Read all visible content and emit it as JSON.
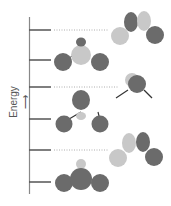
{
  "axis": {
    "label": "Energy",
    "arrow": "↑"
  },
  "colors": {
    "dark_lobe": "#6b6b6b",
    "light_lobe": "#c8c8c8",
    "axis": "#777777",
    "bond": "#333333",
    "dotted": "#aaaaaa"
  },
  "levels": [
    {
      "index": 1,
      "y": 182,
      "side": "left",
      "orbital": "bonding-all-in-phase"
    },
    {
      "index": 2,
      "y": 150,
      "side": "right",
      "orbital": "p-type-node"
    },
    {
      "index": 3,
      "y": 119,
      "side": "left",
      "orbital": "central-lobe-bent"
    },
    {
      "index": 4,
      "y": 87,
      "side": "right",
      "orbital": "nonbonding-single-center"
    },
    {
      "index": 5,
      "y": 60,
      "side": "left",
      "orbital": "antibonding-central"
    },
    {
      "index": 6,
      "y": 30,
      "side": "right",
      "orbital": "antibonding-p-type"
    }
  ]
}
